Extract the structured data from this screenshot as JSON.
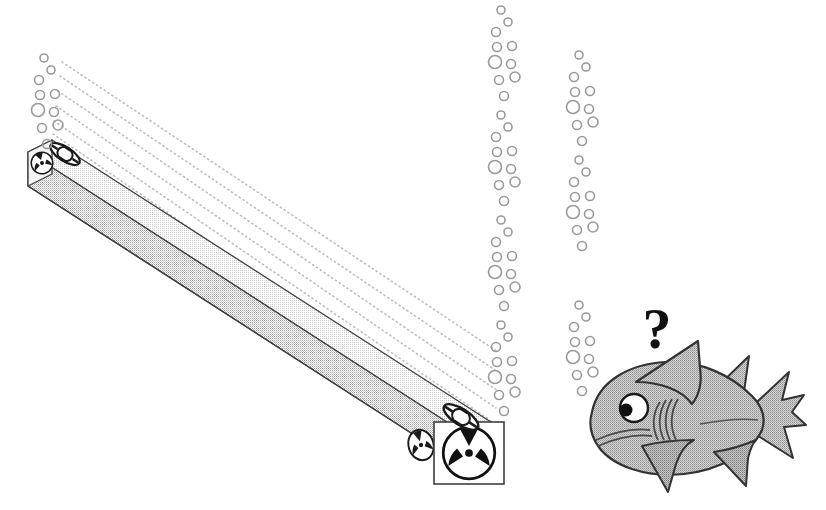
{
  "illustration": {
    "title": "Underwater linear radiation source and curious shark",
    "background_color": "#ffffff",
    "width": 826,
    "height": 510
  },
  "beam": {
    "name": "long rectangular underwater tube",
    "top_face_color": "#f2f2f2",
    "front_face_color": "#d8d8d8",
    "outline_color": "#3a3a3a",
    "left_end": {
      "x": 28,
      "y": 146
    },
    "right_end": {
      "x": 470,
      "y": 430
    }
  },
  "end_caps": {
    "left": {
      "label": "radiation-symbol-small",
      "symbol": "radiation-trefoil",
      "ring_label": "ellipse-ring"
    },
    "right": {
      "label": "radiation-symbol-large",
      "symbol": "radiation-trefoil",
      "ring_label": "ellipse-ring",
      "frame": "square-frame"
    }
  },
  "rays": {
    "name": "dotted emission rays",
    "count": 6,
    "color": "#b5b5b5",
    "style": "dotted"
  },
  "bubbles": {
    "color": "#9a9a9a",
    "columns": [
      {
        "name": "bubble-column-left-top",
        "x": 38,
        "y_start": 58,
        "repeats": 1
      },
      {
        "name": "bubble-column-center",
        "x": 495,
        "y_start": 10,
        "repeats": 4
      },
      {
        "name": "bubble-column-right-upper",
        "x": 573,
        "y_start": 55,
        "repeats": 1
      },
      {
        "name": "bubble-column-right-middle",
        "x": 573,
        "y_start": 160,
        "repeats": 1
      },
      {
        "name": "bubble-column-right-lower",
        "x": 573,
        "y_start": 305,
        "repeats": 1
      }
    ],
    "motif": [
      {
        "dx": 6,
        "dy": 0,
        "r": 4.0
      },
      {
        "dx": 13,
        "dy": 12,
        "r": 4.0
      },
      {
        "dx": 1,
        "dy": 22,
        "r": 4.5
      },
      {
        "dx": 2,
        "dy": 37,
        "r": 4.5
      },
      {
        "dx": 17,
        "dy": 36,
        "r": 4.5
      },
      {
        "dx": 0,
        "dy": 52,
        "r": 6.5
      },
      {
        "dx": 16,
        "dy": 54,
        "r": 4.5
      },
      {
        "dx": 4,
        "dy": 70,
        "r": 4.5
      },
      {
        "dx": 20,
        "dy": 67,
        "r": 5.0
      },
      {
        "dx": 9,
        "dy": 86,
        "r": 4.5
      }
    ],
    "period": 105
  },
  "shark": {
    "name": "curious shark",
    "body_color": "#b3b3b3",
    "outline_color": "#333333",
    "eye_color": "#ffffff",
    "pupil_color": "#000000",
    "question_mark": "?",
    "facing": "left",
    "parts": [
      "body",
      "dorsal-fin",
      "pectoral-fin",
      "pelvic-fin",
      "tail-fin",
      "gills",
      "mouth",
      "eye"
    ]
  }
}
